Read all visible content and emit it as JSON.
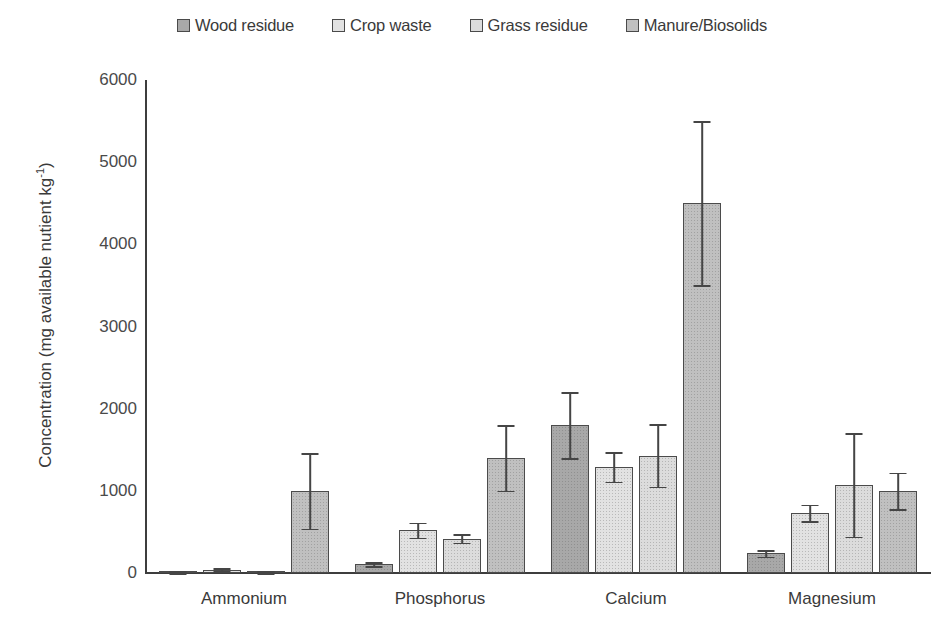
{
  "chart_data": {
    "type": "bar",
    "title": "",
    "xlabel": "",
    "ylabel": "Concentration (mg available nutient kg-1)",
    "ylabel_text": "Concentration (mg available nutient kg",
    "ylabel_sup": "-1",
    "ylabel_tail": ")",
    "categories": [
      "Ammonium",
      "Phosphorus",
      "Calcium",
      "Magnesium"
    ],
    "ylim": [
      0,
      6000
    ],
    "yticks": [
      0,
      1000,
      2000,
      3000,
      4000,
      5000,
      6000
    ],
    "ytick_labels": [
      "0",
      "1000",
      "2000",
      "3000",
      "4000",
      "5000",
      "6000"
    ],
    "grid": false,
    "legend_position": "top-center",
    "error_bars": "symmetric-std-dev",
    "series": [
      {
        "name": "Wood residue",
        "color": "#a8a8a8",
        "values": [
          10,
          110,
          1800,
          240
        ],
        "errors": [
          10,
          25,
          400,
          40
        ]
      },
      {
        "name": "Crop waste",
        "color": "#e2e2e2",
        "values": [
          40,
          520,
          1290,
          730
        ],
        "errors": [
          20,
          90,
          180,
          100
        ]
      },
      {
        "name": "Grass residue",
        "color": "#dcdcdc",
        "values": [
          10,
          420,
          1430,
          1070
        ],
        "errors": [
          10,
          50,
          380,
          630
        ]
      },
      {
        "name": "Manure/Biosolids",
        "color": "#c0c0c0",
        "values": [
          1000,
          1400,
          4500,
          1000
        ],
        "errors": [
          460,
          400,
          1000,
          220
        ]
      }
    ]
  },
  "legend": {
    "entries": [
      {
        "label": "Wood residue",
        "color": "#a8a8a8",
        "swatch": "legend-swatch-wood-residue"
      },
      {
        "label": "Crop waste",
        "color": "#e2e2e2",
        "swatch": "legend-swatch-crop-waste"
      },
      {
        "label": "Grass residue",
        "color": "#dcdcdc",
        "swatch": "legend-swatch-grass-residue"
      },
      {
        "label": "Manure/Biosolids",
        "color": "#c0c0c0",
        "swatch": "legend-swatch-manure-biosolids"
      }
    ]
  },
  "colors": {
    "axis": "#3d3d3d",
    "text": "#3a3a3a",
    "bar_outline": "#4b4b4b",
    "background": "#ffffff"
  }
}
